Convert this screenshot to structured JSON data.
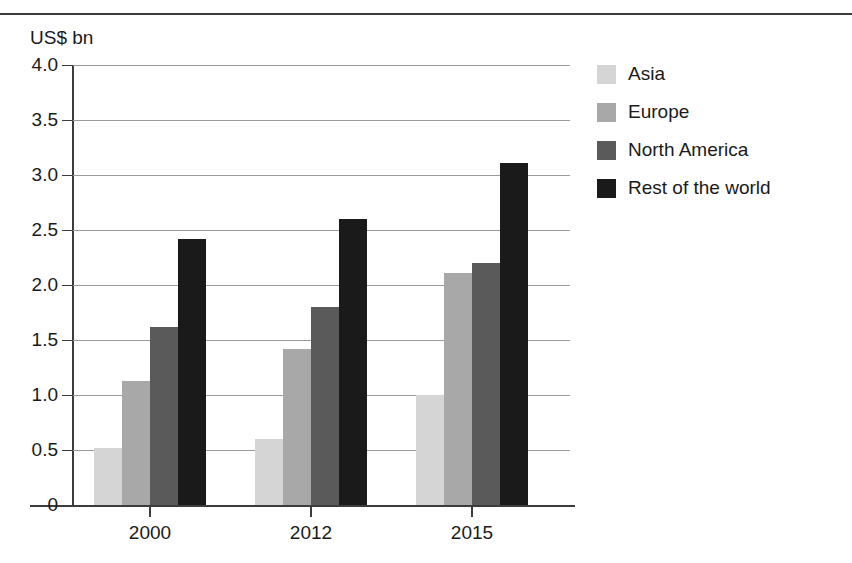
{
  "chart_data": {
    "type": "bar",
    "title": "",
    "subtitle": "",
    "xlabel": "",
    "ylabel": "US$ bn",
    "unit_caption": "US$ bn",
    "categories": [
      "2000",
      "2012",
      "2015"
    ],
    "series": [
      {
        "name": "Asia",
        "color": "#d5d5d5",
        "values": [
          0.52,
          0.6,
          1.0
        ]
      },
      {
        "name": "Europe",
        "color": "#a8a8a8",
        "values": [
          1.13,
          1.42,
          2.11
        ]
      },
      {
        "name": "North America",
        "color": "#5a5a5a",
        "values": [
          1.62,
          1.8,
          2.2
        ]
      },
      {
        "name": "Rest of the world",
        "color": "#1a1a1a",
        "values": [
          2.42,
          2.6,
          3.11
        ]
      }
    ],
    "ylim": [
      0,
      4.0
    ],
    "ytick_values": [
      0,
      0.5,
      1.0,
      1.5,
      2.0,
      2.5,
      3.0,
      3.5,
      4.0
    ],
    "ytick_labels": [
      "0",
      "0.5",
      "1.0",
      "1.5",
      "2.0",
      "2.5",
      "3.0",
      "3.5",
      "4.0"
    ],
    "grid": true,
    "grid_orientation": "horizontal",
    "legend_position": "right",
    "bar_grouping": "grouped",
    "bars_touch_within_group": true
  },
  "legend": {
    "entries": [
      {
        "label": "Asia",
        "color": "#d5d5d5"
      },
      {
        "label": "Europe",
        "color": "#a8a8a8"
      },
      {
        "label": "North America",
        "color": "#5a5a5a"
      },
      {
        "label": "Rest of the world",
        "color": "#1a1a1a"
      }
    ]
  },
  "decorations": {
    "top_rule_color": "#3c3c3c",
    "axis_color": "#3c3c3c",
    "gridline_color": "#9a9a9a",
    "background_color": "#ffffff",
    "text_color": "#1a1a1a"
  }
}
